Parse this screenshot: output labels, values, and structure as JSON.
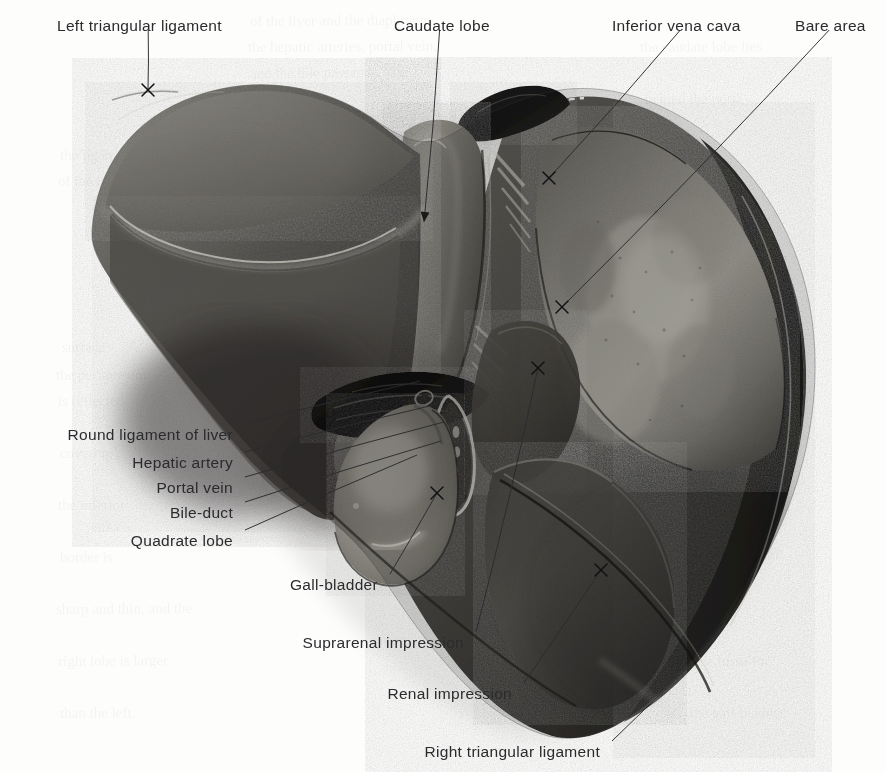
{
  "figure": {
    "kind": "anatomical-photograph",
    "background_color": "#fdfdfc",
    "label_color": "#2b2b2e",
    "leader_color": "#25252a"
  },
  "labels": [
    {
      "id": "left-triangular-ligament",
      "text": "Left triangular ligament",
      "anchor": "start",
      "x": 57,
      "y": 19,
      "tip_x": 148,
      "tip_y": 90,
      "marker": "x"
    },
    {
      "id": "caudate-lobe",
      "text": "Caudate lobe",
      "anchor": "start",
      "x": 394,
      "y": 19,
      "tip_x": 424,
      "tip_y": 222,
      "marker": "arrow"
    },
    {
      "id": "inferior-vena-cava",
      "text": "Inferior vena cava",
      "anchor": "start",
      "x": 612,
      "y": 19,
      "tip_x": 549,
      "tip_y": 178,
      "marker": "x"
    },
    {
      "id": "bare-area",
      "text": "Bare area",
      "anchor": "start",
      "x": 795,
      "y": 19,
      "tip_x": 562,
      "tip_y": 307,
      "marker": "x"
    },
    {
      "id": "round-ligament-of-liver",
      "text": "Round ligament of liver",
      "anchor": "end",
      "x": 233,
      "y": 428,
      "tip_x": 420,
      "tip_y": 381,
      "marker": "none"
    },
    {
      "id": "hepatic-artery",
      "text": "Hepatic artery",
      "anchor": "end",
      "x": 233,
      "y": 456,
      "tip_x": 438,
      "tip_y": 404,
      "marker": "none"
    },
    {
      "id": "portal-vein",
      "text": "Portal vein",
      "anchor": "end",
      "x": 233,
      "y": 481,
      "tip_x": 444,
      "tip_y": 422,
      "marker": "none"
    },
    {
      "id": "bile-duct",
      "text": "Bile-duct",
      "anchor": "end",
      "x": 233,
      "y": 506,
      "tip_x": 441,
      "tip_y": 441,
      "marker": "none"
    },
    {
      "id": "quadrate-lobe",
      "text": "Quadrate lobe",
      "anchor": "end",
      "x": 233,
      "y": 534,
      "tip_x": 417,
      "tip_y": 455,
      "marker": "none"
    },
    {
      "id": "gall-bladder",
      "text": "Gall-bladder",
      "anchor": "end",
      "x": 378,
      "y": 578,
      "tip_x": 437,
      "tip_y": 493,
      "marker": "x"
    },
    {
      "id": "suprarenal-impression",
      "text": "Suprarenal impression",
      "anchor": "end",
      "x": 464,
      "y": 636,
      "tip_x": 538,
      "tip_y": 368,
      "marker": "x"
    },
    {
      "id": "renal-impression",
      "text": "Renal impression",
      "anchor": "end",
      "x": 512,
      "y": 687,
      "tip_x": 601,
      "tip_y": 570,
      "marker": "x"
    },
    {
      "id": "right-triangular-ligament",
      "text": "Right triangular ligament",
      "anchor": "end",
      "x": 600,
      "y": 745,
      "tip_x": 712,
      "tip_y": 644,
      "marker": "none"
    }
  ],
  "structures": [
    {
      "id": "left-lobe",
      "name": "Left lobe of liver"
    },
    {
      "id": "right-lobe",
      "name": "Right lobe of liver"
    },
    {
      "id": "caudate-lobe",
      "name": "Caudate lobe"
    },
    {
      "id": "quadrate-lobe",
      "name": "Quadrate lobe"
    },
    {
      "id": "gall-bladder",
      "name": "Gall-bladder"
    },
    {
      "id": "bare-area",
      "name": "Bare area"
    },
    {
      "id": "porta-hepatis",
      "name": "Porta hepatis"
    },
    {
      "id": "inferior-vena-cava",
      "name": "Inferior vena cava groove"
    }
  ],
  "show_through": [
    {
      "text": "of the liver and the diaphragm",
      "x": 250,
      "y": 26
    },
    {
      "text": "the hepatic arteries, portal vein,",
      "x": 248,
      "y": 52
    },
    {
      "text": "and the bile passages. The",
      "x": 250,
      "y": 78
    },
    {
      "text": "fissure",
      "x": 252,
      "y": 104
    },
    {
      "text": "the ligament",
      "x": 60,
      "y": 160
    },
    {
      "text": "of the liver",
      "x": 58,
      "y": 186
    },
    {
      "text": "surface",
      "x": 62,
      "y": 352
    },
    {
      "text": "the peritoneum",
      "x": 56,
      "y": 380
    },
    {
      "text": "is reflected",
      "x": 58,
      "y": 406
    },
    {
      "text": "covering",
      "x": 60,
      "y": 458
    },
    {
      "text": "the inferior",
      "x": 58,
      "y": 510
    },
    {
      "text": "border is",
      "x": 60,
      "y": 562
    },
    {
      "text": "sharp and thin, and the",
      "x": 56,
      "y": 614
    },
    {
      "text": "right lobe is larger",
      "x": 58,
      "y": 666
    },
    {
      "text": "than the left.",
      "x": 60,
      "y": 718
    },
    {
      "text": "the caudate lobe lies",
      "x": 640,
      "y": 52
    },
    {
      "text": "behind the porta",
      "x": 645,
      "y": 104
    },
    {
      "text": "impression",
      "x": 700,
      "y": 352
    },
    {
      "text": "of the colon",
      "x": 700,
      "y": 404
    },
    {
      "text": "and duodenum",
      "x": 690,
      "y": 560
    },
    {
      "text": "the fossa for",
      "x": 695,
      "y": 666
    },
    {
      "text": "the gall-bladder",
      "x": 690,
      "y": 718
    }
  ]
}
